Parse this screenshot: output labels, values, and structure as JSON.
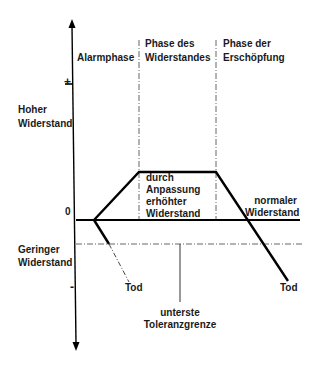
{
  "diagram": {
    "y_axis": {
      "plus_label": "+",
      "zero_label": "0",
      "minus_label": "-",
      "high_label": "Hoher\nWiderstand",
      "low_label": "Geringer\nWiderstand"
    },
    "phases": [
      {
        "label": "Alarmphase"
      },
      {
        "label": "Phase des\nWiderstandes"
      },
      {
        "label": "Phase der\nErschöpfung"
      }
    ],
    "annotations": {
      "plateau": "durch\nAnpassung\nerhöhter\nWiderstand",
      "normal": "normaler\nWiderstand",
      "death_early": "Tod",
      "death_late": "Tod",
      "tolerance": "unterste\nToleranzgrenze"
    },
    "colors": {
      "line": "#000000",
      "text": "#1a1a1a",
      "dashed": "#555555"
    }
  }
}
